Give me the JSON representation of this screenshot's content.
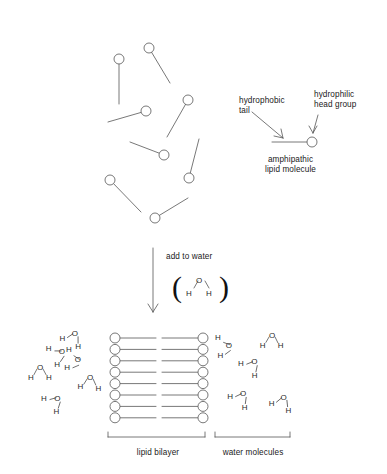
{
  "figure": {
    "background_color": "#ffffff",
    "stroke_color": "#555555",
    "text_color": "#1a1a1a"
  },
  "panels": {
    "top": {
      "name": "dispersed lipid molecules",
      "lipids": [
        {
          "head_x": 149,
          "head_y": 48,
          "tail_x": 170,
          "tail_y": 83
        },
        {
          "head_x": 119,
          "head_y": 59,
          "tail_x": 119,
          "tail_y": 104
        },
        {
          "head_x": 146,
          "head_y": 111,
          "tail_x": 108,
          "tail_y": 122
        },
        {
          "head_x": 188,
          "head_y": 100,
          "tail_x": 167,
          "tail_y": 137
        },
        {
          "head_x": 164,
          "head_y": 155,
          "tail_x": 130,
          "tail_y": 142
        },
        {
          "head_x": 189,
          "head_y": 178,
          "tail_x": 199,
          "tail_y": 139
        },
        {
          "head_x": 110,
          "head_y": 180,
          "tail_x": 141,
          "tail_y": 212
        },
        {
          "head_x": 155,
          "head_y": 218,
          "tail_x": 188,
          "tail_y": 198
        }
      ]
    },
    "legend": {
      "name": "amphipathic lipid key",
      "hydrophobic_label": "hydrophobic\ntail",
      "hydrophilic_label": "hydrophilic\nhead group",
      "molecule_label": "amphipathic\nlipid molecule",
      "head_x": 312,
      "head_y": 142,
      "tail_x": 272,
      "tail_y": 142
    },
    "transition": {
      "name": "add to water step",
      "arrow_label": "add to water",
      "arrow_x": 153,
      "arrow_top": 248,
      "arrow_bottom": 312,
      "water_molecule": {
        "oxygen": "O",
        "hydrogen_left": "H",
        "hydrogen_right": "H",
        "paren_open": "(",
        "paren_close": ")"
      }
    },
    "bottom": {
      "name": "assembled bilayer in water",
      "bilayer": {
        "label": "lipid bilayer",
        "rows": 8,
        "left_head_x": 115,
        "right_head_x": 203,
        "top_y": 338,
        "row_spacing": 11.4,
        "head_radius": 5.0,
        "midline_gap": 6
      },
      "water_label": "water molecules",
      "water_molecules_left": [
        {
          "x": 40,
          "y": 372,
          "rot": 0
        },
        {
          "x": 74,
          "y": 338,
          "rot": 28
        },
        {
          "x": 60,
          "y": 355,
          "rot": 62
        },
        {
          "x": 76,
          "y": 362,
          "rot": 95
        },
        {
          "x": 90,
          "y": 382,
          "rot": 4
        },
        {
          "x": 56,
          "y": 402,
          "rot": 46
        }
      ],
      "water_molecules_right": [
        {
          "x": 227,
          "y": 348,
          "rot": 82
        },
        {
          "x": 272,
          "y": 340,
          "rot": 2
        },
        {
          "x": 253,
          "y": 366,
          "rot": 40
        },
        {
          "x": 242,
          "y": 398,
          "rot": 36
        },
        {
          "x": 283,
          "y": 402,
          "rot": 22
        }
      ],
      "brackets": [
        {
          "name": "lipid-bilayer-bracket",
          "x1": 108,
          "x2": 205,
          "y": 437
        },
        {
          "name": "water-molecules-bracket",
          "x1": 215,
          "x2": 290,
          "y": 437
        }
      ]
    }
  },
  "chart_data": {
    "type": "diagram",
    "stages": [
      {
        "stage": 1,
        "description": "dispersed amphipathic lipid molecules",
        "count": 8
      },
      {
        "stage": 2,
        "description": "add to water",
        "reagent": "H2O"
      },
      {
        "stage": 3,
        "description": "lipid bilayer with surrounding water molecules",
        "bilayer_rows": 8,
        "water_count": 11
      }
    ],
    "labels": [
      "hydrophobic tail",
      "hydrophilic head group",
      "amphipathic lipid molecule",
      "add to water",
      "lipid bilayer",
      "water molecules"
    ]
  }
}
